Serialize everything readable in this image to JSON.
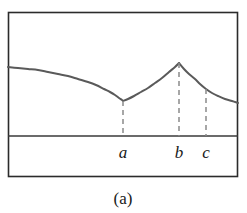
{
  "figure": {
    "caption": "(a)",
    "frame": {
      "x": 8,
      "y": 12,
      "width": 230,
      "height": 165,
      "border_color": "#2b2b2b",
      "background": "#ffffff"
    },
    "axis": {
      "y": 136,
      "x_start": 8,
      "x_end": 238,
      "color": "#3a3a3a"
    },
    "tick_labels": [
      {
        "name": "a",
        "text": "a",
        "x": 123,
        "y": 158
      },
      {
        "name": "b",
        "text": "b",
        "x": 179,
        "y": 158
      },
      {
        "name": "c",
        "text": "c",
        "x": 206,
        "y": 158
      }
    ],
    "dashed_lines": [
      {
        "name": "a",
        "x": 123,
        "y_top": 101,
        "y_bottom": 136
      },
      {
        "name": "b",
        "x": 179,
        "y_top": 63,
        "y_bottom": 136
      },
      {
        "name": "c",
        "x": 206,
        "y_top": 89,
        "y_bottom": 136
      }
    ],
    "curve_color": "#5a5a5a",
    "dash_color": "#8a8a8a"
  },
  "chart_data": {
    "type": "line",
    "title": "",
    "subtitle": "",
    "xlabel": "",
    "ylabel": "",
    "caption": "(a)",
    "xlim": [
      8,
      238
    ],
    "ylim": [
      136,
      12
    ],
    "grid": false,
    "legend": null,
    "axis_tick_labels": [
      "a",
      "b",
      "c"
    ],
    "axis_tick_positions": [
      123,
      179,
      206
    ],
    "annotations": [
      {
        "type": "dashed-vertical",
        "label": "a",
        "x": 123,
        "from_y": 136,
        "to_y": 101
      },
      {
        "type": "dashed-vertical",
        "label": "b",
        "x": 179,
        "from_y": 136,
        "to_y": 63
      },
      {
        "type": "dashed-vertical",
        "label": "c",
        "x": 206,
        "from_y": 136,
        "to_y": 89
      }
    ],
    "series": [
      {
        "name": "curve",
        "description": "Concave-decreasing branch to a cusp minimum at a, rising concave branch to a sharp peak at b, then a concave-decreasing branch past c to the right edge.",
        "points": [
          [
            8,
            67
          ],
          [
            18,
            68
          ],
          [
            28,
            69
          ],
          [
            38,
            70
          ],
          [
            48,
            72
          ],
          [
            58,
            74
          ],
          [
            68,
            76
          ],
          [
            78,
            79
          ],
          [
            88,
            82
          ],
          [
            96,
            85
          ],
          [
            104,
            89
          ],
          [
            110,
            92
          ],
          [
            115,
            95
          ],
          [
            119,
            98
          ],
          [
            122,
            100
          ],
          [
            123,
            101
          ],
          [
            128,
            99
          ],
          [
            134,
            96
          ],
          [
            141,
            92
          ],
          [
            148,
            88
          ],
          [
            155,
            83
          ],
          [
            162,
            78
          ],
          [
            169,
            72
          ],
          [
            175,
            67
          ],
          [
            179,
            63
          ],
          [
            184,
            69
          ],
          [
            189,
            74
          ],
          [
            195,
            79
          ],
          [
            200,
            84
          ],
          [
            206,
            89
          ],
          [
            212,
            93
          ],
          [
            218,
            96
          ],
          [
            225,
            99
          ],
          [
            232,
            101
          ],
          [
            238,
            103
          ]
        ]
      }
    ],
    "key_points": [
      {
        "label": "cusp-minimum-at-a",
        "x": 123,
        "y": 101
      },
      {
        "label": "peak-maximum-at-b",
        "x": 179,
        "y": 63
      },
      {
        "label": "point-at-c",
        "x": 206,
        "y": 89
      },
      {
        "label": "left-edge-start",
        "x": 8,
        "y": 67
      },
      {
        "label": "right-edge-end",
        "x": 238,
        "y": 103
      }
    ]
  }
}
